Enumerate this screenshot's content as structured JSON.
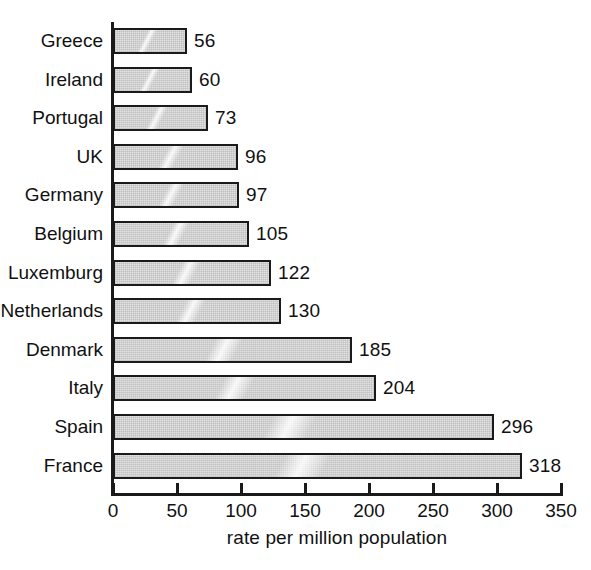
{
  "chart_data": {
    "type": "bar",
    "orientation": "horizontal",
    "title": "",
    "subtitle": "",
    "xlabel": "rate per million population",
    "ylabel": "",
    "categories": [
      "Greece",
      "Ireland",
      "Portugal",
      "UK",
      "Germany",
      "Belgium",
      "Luxemburg",
      "Netherlands",
      "Denmark",
      "Italy",
      "Spain",
      "France"
    ],
    "values": [
      56,
      60,
      73,
      96,
      97,
      105,
      122,
      130,
      185,
      204,
      296,
      318
    ],
    "value_labels": [
      "56",
      "60",
      "73",
      "96",
      "97",
      "105",
      "122",
      "130",
      "185",
      "204",
      "296",
      "318"
    ],
    "xlim": [
      0,
      350
    ],
    "xticks": [
      0,
      50,
      100,
      150,
      200,
      250,
      300,
      350
    ],
    "xtick_labels": [
      "0",
      "50",
      "100",
      "150",
      "200",
      "250",
      "300",
      "350"
    ],
    "grid": false,
    "legend": null,
    "legend_position": "none",
    "bar_fill_color": "#e2e2e2",
    "bar_border_color": "#1a1a1a",
    "axis_color": "#1a1a1a",
    "text_color": "#111111",
    "background_color": "#ffffff"
  }
}
